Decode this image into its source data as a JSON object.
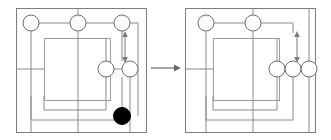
{
  "figure": {
    "colors": {
      "wire": "#8a8a8a",
      "frame": "#7d7d7d",
      "node_open_stroke": "#6e6e6e",
      "node_open_fill": "#ffffff",
      "node_filled": "#000000",
      "background": "#ffffff",
      "arrow": "#6a6a6a"
    },
    "panels": [
      {
        "id": "before",
        "label": "",
        "frame": {
          "x": 16,
          "y": 8,
          "width": 130,
          "height": 124
        },
        "inner_box": {
          "x": 44,
          "y": 38,
          "width": 66,
          "height": 62
        },
        "nodes": [
          {
            "id": "n1",
            "cx": 31,
            "cy": 23,
            "r": 8,
            "state": "open"
          },
          {
            "id": "n2",
            "cx": 78,
            "cy": 23,
            "r": 8,
            "state": "open"
          },
          {
            "id": "n3",
            "cx": 122,
            "cy": 23,
            "r": 8,
            "state": "open"
          },
          {
            "id": "n4",
            "cx": 106,
            "cy": 69,
            "r": 8,
            "state": "open"
          },
          {
            "id": "n5",
            "cx": 130,
            "cy": 69,
            "r": 8,
            "state": "open"
          },
          {
            "id": "n6",
            "cx": 122,
            "cy": 116,
            "r": 8,
            "state": "filled"
          }
        ],
        "double_arrow": {
          "x": 122,
          "y_top": 33,
          "y_bottom": 61
        }
      },
      {
        "id": "after",
        "label": "",
        "frame": {
          "x": 185,
          "y": 8,
          "width": 130,
          "height": 124
        },
        "inner_box": {
          "x": 213,
          "y": 38,
          "width": 66,
          "height": 62
        },
        "nodes": [
          {
            "id": "m1",
            "cx": 206,
            "cy": 23,
            "r": 8,
            "state": "open"
          },
          {
            "id": "m2",
            "cx": 253,
            "cy": 23,
            "r": 8,
            "state": "open"
          },
          {
            "id": "m3",
            "cx": 277,
            "cy": 69,
            "r": 8,
            "state": "open"
          },
          {
            "id": "m4",
            "cx": 293,
            "cy": 69,
            "r": 8,
            "state": "open"
          },
          {
            "id": "m5",
            "cx": 309,
            "cy": 69,
            "r": 8,
            "state": "open"
          }
        ],
        "double_arrow": {
          "x": 293,
          "y_top": 33,
          "y_bottom": 61
        }
      }
    ],
    "transform_arrow": {
      "name": "maps-to",
      "x_start": 151,
      "x_end": 180,
      "y": 68,
      "direction": "right"
    }
  }
}
